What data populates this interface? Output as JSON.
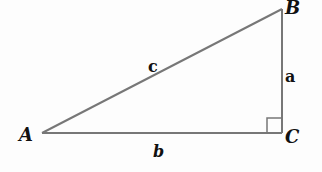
{
  "diagram": {
    "type": "right-triangle",
    "vertices": {
      "A": {
        "label": "A",
        "x": 42,
        "y": 133
      },
      "B": {
        "label": "B",
        "x": 282,
        "y": 9
      },
      "C": {
        "label": "C",
        "x": 282,
        "y": 133
      }
    },
    "sides": {
      "a": {
        "label": "a",
        "between": "B-C"
      },
      "b": {
        "label": "b",
        "between": "A-C"
      },
      "c": {
        "label": "c",
        "between": "A-B"
      }
    },
    "right_angle_at": "C",
    "line_color": "#777777",
    "text_color": "#111111"
  }
}
